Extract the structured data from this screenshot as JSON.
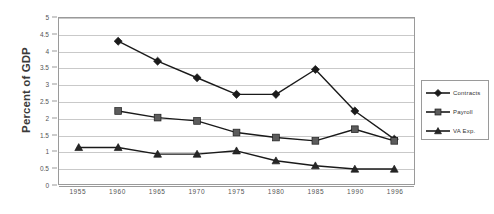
{
  "chart_data": {
    "type": "line",
    "title": "",
    "xlabel": "",
    "ylabel": "Percent of GDP",
    "ylim": [
      0,
      5
    ],
    "xlim": [
      1955,
      1996
    ],
    "grid": true,
    "legend_position": "right",
    "categories": [
      "1955",
      "1960",
      "1965",
      "1970",
      "1975",
      "1980",
      "1985",
      "1990",
      "1996"
    ],
    "y_ticks": [
      "0",
      "0.5",
      "1",
      "1.5",
      "2",
      "2.5",
      "3",
      "3.5",
      "4",
      "4.5",
      "5"
    ],
    "y_tick_values": [
      0,
      0.5,
      1,
      1.5,
      2,
      2.5,
      3,
      3.5,
      4,
      4.5,
      5
    ],
    "series": [
      {
        "name": "Contracts",
        "marker": "diamond",
        "color": "#1a1a1a",
        "x": [
          "1960",
          "1965",
          "1970",
          "1975",
          "1980",
          "1985",
          "1990",
          "1996"
        ],
        "values": [
          4.3,
          3.7,
          3.2,
          2.7,
          2.7,
          3.45,
          2.2,
          1.35
        ]
      },
      {
        "name": "Payroll",
        "marker": "square",
        "color": "#5c5c5c",
        "x": [
          "1960",
          "1965",
          "1970",
          "1975",
          "1980",
          "1985",
          "1990",
          "1996"
        ],
        "values": [
          2.2,
          2.0,
          1.9,
          1.55,
          1.4,
          1.3,
          1.65,
          1.3
        ]
      },
      {
        "name": "VA Exp.",
        "marker": "triangle",
        "color": "#262626",
        "x": [
          "1955",
          "1960",
          "1965",
          "1970",
          "1975",
          "1980",
          "1985",
          "1990",
          "1996"
        ],
        "values": [
          1.1,
          1.1,
          0.9,
          0.9,
          1.0,
          0.7,
          0.55,
          0.45,
          0.45
        ]
      }
    ]
  },
  "legend": {
    "items": [
      {
        "label": "Contracts"
      },
      {
        "label": "Payroll"
      },
      {
        "label": "VA Exp."
      }
    ]
  },
  "axis": {
    "y_title": "Percent of GDP"
  }
}
